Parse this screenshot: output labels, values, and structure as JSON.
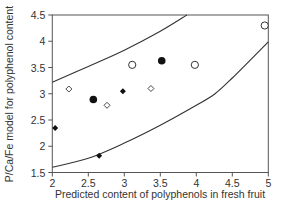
{
  "chart_data": {
    "type": "scatter",
    "title": "",
    "xlabel": "Predicted content of polyphenols in fresh fruit",
    "ylabel": "P/Ca/Fe model for polyphenol content",
    "xlim": [
      2,
      5
    ],
    "ylim": [
      1.5,
      4.5
    ],
    "xticks": [
      "2",
      "2.5",
      "3",
      "3.5",
      "4",
      "4.5",
      "5"
    ],
    "yticks": [
      "1.5",
      "2",
      "2.5",
      "3",
      "3.5",
      "4",
      "4.5"
    ],
    "grid": false,
    "legend": "none",
    "series": [
      {
        "name": "open-circle",
        "marker": "open-circle",
        "points": [
          [
            3.11,
            3.55
          ],
          [
            3.98,
            3.55
          ],
          [
            4.95,
            4.3
          ]
        ]
      },
      {
        "name": "filled-circle",
        "marker": "filled-circle",
        "points": [
          [
            2.57,
            2.89
          ],
          [
            3.52,
            3.63
          ]
        ]
      },
      {
        "name": "open-diamond",
        "marker": "open-diamond",
        "points": [
          [
            2.23,
            3.09
          ],
          [
            2.76,
            2.78
          ],
          [
            3.37,
            3.1
          ]
        ]
      },
      {
        "name": "filled-diamond",
        "marker": "filled-diamond",
        "points": [
          [
            2.04,
            2.35
          ],
          [
            2.98,
            3.05
          ],
          [
            2.65,
            1.82
          ]
        ]
      }
    ],
    "bands": [
      {
        "name": "upper-confidence-curve",
        "points": [
          [
            2.0,
            3.22
          ],
          [
            2.5,
            3.52
          ],
          [
            3.0,
            3.83
          ],
          [
            3.5,
            4.19
          ],
          [
            3.87,
            4.5
          ]
        ]
      },
      {
        "name": "lower-confidence-curve",
        "points": [
          [
            2.0,
            1.6
          ],
          [
            2.5,
            1.77
          ],
          [
            3.0,
            2.06
          ],
          [
            3.5,
            2.4
          ],
          [
            4.0,
            2.78
          ],
          [
            4.26,
            3.0
          ],
          [
            4.5,
            3.3
          ],
          [
            5.0,
            3.99
          ]
        ]
      }
    ]
  }
}
